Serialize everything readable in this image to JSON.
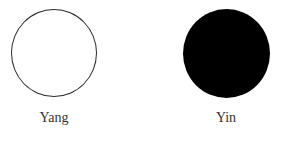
{
  "diagram": {
    "items": [
      {
        "label": "Yang",
        "fill": "#ffffff",
        "stroke": "#2a2a2a"
      },
      {
        "label": "Yin",
        "fill": "#000000",
        "stroke": "#000000"
      }
    ]
  }
}
